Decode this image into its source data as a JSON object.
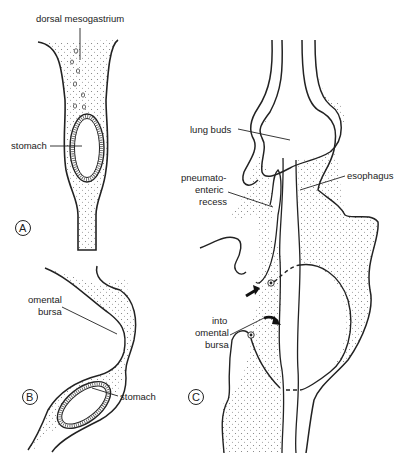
{
  "panels": {
    "A": {
      "letter": "A",
      "labels": {
        "dorsal_mesogastrium": "dorsal mesogastrium",
        "stomach": "stomach"
      }
    },
    "B": {
      "letter": "B",
      "labels": {
        "omental_bursa_1": "omental",
        "omental_bursa_2": "bursa",
        "stomach": "stomach"
      }
    },
    "C": {
      "letter": "C",
      "labels": {
        "lung_buds": "lung buds",
        "pneumato_1": "pneumato-",
        "pneumato_2": "enteric",
        "pneumato_3": "recess",
        "esophagus": "esophagus",
        "into_1": "into",
        "into_2": "omental",
        "into_3": "bursa"
      }
    }
  },
  "colors": {
    "ink": "#222222",
    "stipple": "#888888",
    "background": "#ffffff"
  }
}
